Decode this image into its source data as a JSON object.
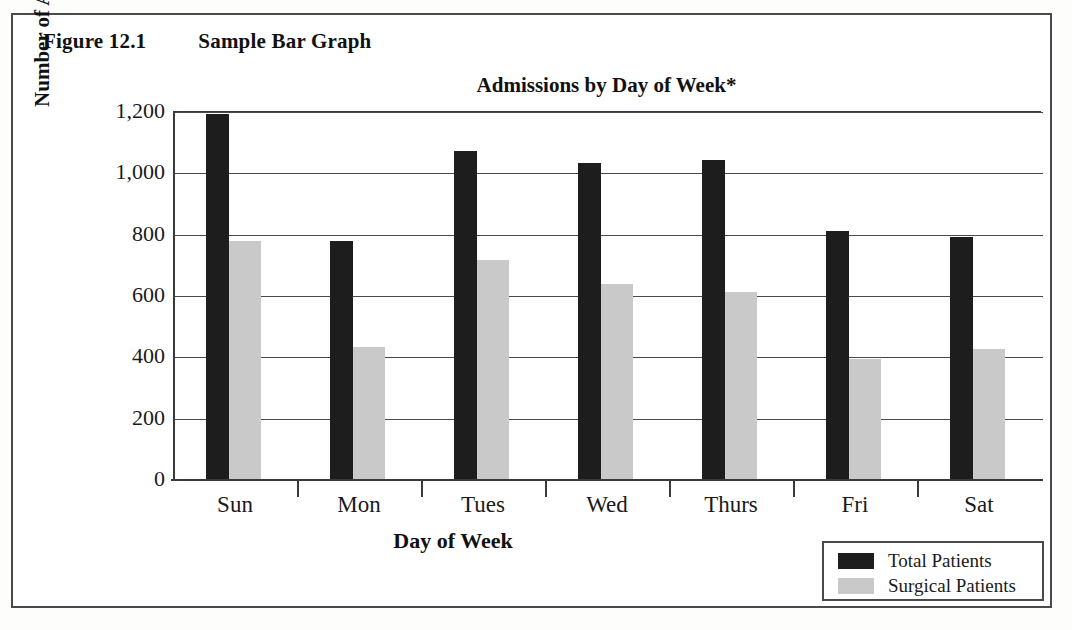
{
  "figure": {
    "number": "Figure 12.1",
    "caption": "Sample Bar Graph"
  },
  "legend": {
    "position": "bottom-right",
    "entries": [
      {
        "label": "Total Patients",
        "color": "#1d1d1d",
        "swatch": "total"
      },
      {
        "label": "Surgical Patients",
        "color": "#c9c9c9",
        "swatch": "surgical"
      }
    ]
  },
  "chart_data": {
    "type": "bar",
    "title": "Admissions by Day of Week*",
    "xlabel": "Day of Week",
    "ylabel": "Number of Admissions",
    "categories": [
      "Sun",
      "Mon",
      "Tues",
      "Wed",
      "Thurs",
      "Fri",
      "Sat"
    ],
    "series": [
      {
        "name": "Total Patients",
        "color": "#1d1d1d",
        "values": [
          1190,
          775,
          1070,
          1030,
          1040,
          810,
          790
        ]
      },
      {
        "name": "Surgical Patients",
        "color": "#c9c9c9",
        "values": [
          775,
          430,
          715,
          635,
          610,
          390,
          425
        ]
      }
    ],
    "ylim": [
      0,
      1200
    ],
    "ytick_values": [
      1200,
      1000,
      800,
      600,
      400,
      200,
      0
    ],
    "ytick_labels": [
      "1,200",
      "1,000",
      "800",
      "600",
      "400",
      "200",
      "0"
    ],
    "grid": true,
    "grid_axis": "y",
    "legend_position": "bottom-right"
  }
}
